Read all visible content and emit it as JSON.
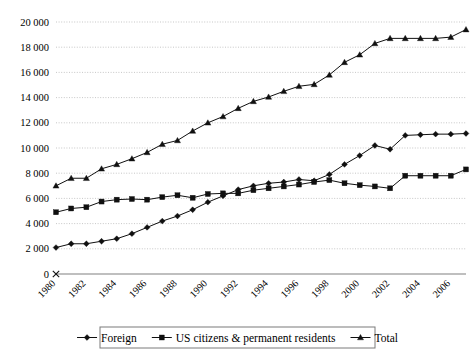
{
  "chart_data": {
    "type": "line",
    "title": "",
    "subtitle": "",
    "xlabel": "",
    "ylabel": "",
    "grid": "horizontal",
    "legend_position": "bottom",
    "xlim": [
      1980,
      2007
    ],
    "ylim": [
      0,
      20000
    ],
    "y_tick_step": 2000,
    "x_tick_step": 2,
    "x": [
      1980,
      1981,
      1982,
      1983,
      1984,
      1985,
      1986,
      1987,
      1988,
      1989,
      1990,
      1991,
      1992,
      1993,
      1994,
      1995,
      1996,
      1997,
      1998,
      1999,
      2000,
      2001,
      2002,
      2003,
      2004,
      2005,
      2006,
      2007
    ],
    "y_tick_labels": [
      "0",
      "2 000",
      "4 000",
      "6 000",
      "8 000",
      "10 000",
      "12 000",
      "14 000",
      "16 000",
      "18 000",
      "20 000"
    ],
    "y_tick_values": [
      0,
      2000,
      4000,
      6000,
      8000,
      10000,
      12000,
      14000,
      16000,
      18000,
      20000
    ],
    "x_tick_labels": [
      "1980",
      "1982",
      "1984",
      "1986",
      "1988",
      "1990",
      "1992",
      "1994",
      "1996",
      "1998",
      "2000",
      "2002",
      "2004",
      "2006"
    ],
    "x_tick_values": [
      1980,
      1982,
      1984,
      1986,
      1988,
      1990,
      1992,
      1994,
      1996,
      1998,
      2000,
      2002,
      2004,
      2006
    ],
    "series": [
      {
        "name": "Foreign",
        "marker": "diamond",
        "color": "#101010",
        "values": [
          2100,
          2400,
          2400,
          2600,
          2800,
          3200,
          3700,
          4200,
          4600,
          5100,
          5700,
          6200,
          6700,
          7000,
          7200,
          7300,
          7500,
          7400,
          7900,
          8700,
          9400,
          10200,
          9900,
          11000,
          11050,
          11100,
          11100,
          11150
        ]
      },
      {
        "name": "US citizens & permanent residents",
        "marker": "square",
        "color": "#101010",
        "values": [
          4900,
          5200,
          5300,
          5750,
          5900,
          5950,
          5900,
          6100,
          6250,
          6050,
          6350,
          6400,
          6400,
          6650,
          6800,
          6950,
          7100,
          7300,
          7450,
          7200,
          7050,
          6950,
          6800,
          7800,
          7800,
          7800,
          7800,
          8300
        ]
      },
      {
        "name": "Total",
        "marker": "triangle",
        "color": "#101010",
        "values": [
          7000,
          7600,
          7600,
          8350,
          8700,
          9150,
          9650,
          10300,
          10600,
          11350,
          12000,
          12500,
          13150,
          13700,
          14050,
          14500,
          14900,
          15050,
          15800,
          16800,
          17400,
          18300,
          18700,
          18700,
          18700,
          18700,
          18800,
          19400
        ]
      }
    ]
  },
  "legend": {
    "items": [
      {
        "label": "Foreign",
        "marker": "diamond"
      },
      {
        "label": "US citizens & permanent residents",
        "marker": "square"
      },
      {
        "label": "Total",
        "marker": "triangle"
      }
    ]
  }
}
